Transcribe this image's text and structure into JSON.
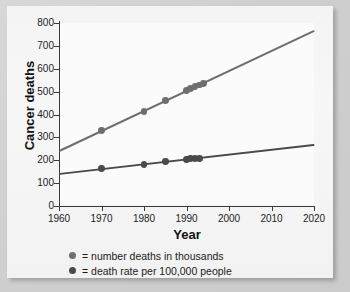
{
  "chart_data": {
    "type": "scatter",
    "title": "",
    "xlabel": "Year",
    "ylabel": "Cancer deaths",
    "xlim": [
      1960,
      2020
    ],
    "ylim": [
      0,
      800
    ],
    "xticks": [
      1960,
      1970,
      1980,
      1990,
      2000,
      2010,
      2020
    ],
    "yticks": [
      0,
      100,
      200,
      300,
      400,
      500,
      600,
      700,
      800
    ],
    "grid": false,
    "legend_position": "below",
    "series": [
      {
        "name": "number deaths in thousands",
        "color": "#6e6e6e",
        "marker": "circle",
        "points": [
          {
            "x": 1970,
            "y": 330
          },
          {
            "x": 1980,
            "y": 414
          },
          {
            "x": 1985,
            "y": 461
          },
          {
            "x": 1990,
            "y": 505
          },
          {
            "x": 1991,
            "y": 514
          },
          {
            "x": 1992,
            "y": 521
          },
          {
            "x": 1993,
            "y": 529
          },
          {
            "x": 1994,
            "y": 534
          }
        ],
        "trendline": {
          "x": [
            1960,
            2020
          ],
          "y": [
            245,
            770
          ]
        }
      },
      {
        "name": "death rate per 100,000 people",
        "color": "#4a4a4a",
        "marker": "circle",
        "points": [
          {
            "x": 1970,
            "y": 163
          },
          {
            "x": 1980,
            "y": 183
          },
          {
            "x": 1985,
            "y": 193
          },
          {
            "x": 1990,
            "y": 205
          },
          {
            "x": 1991,
            "y": 207
          },
          {
            "x": 1992,
            "y": 206
          },
          {
            "x": 1993,
            "y": 206
          }
        ],
        "trendline": {
          "x": [
            1960,
            2020
          ],
          "y": [
            143,
            270
          ]
        }
      }
    ]
  },
  "axes": {
    "y_title": "Cancer deaths",
    "x_title": "Year",
    "y_tick_labels": [
      "800",
      "700",
      "600",
      "500",
      "400",
      "300",
      "200",
      "100",
      "0"
    ],
    "x_tick_labels": [
      "1960",
      "1970",
      "1980",
      "1990",
      "2000",
      "2010",
      "2020"
    ]
  },
  "legend": {
    "items": [
      {
        "marker_name": "legend-dot-number-deaths",
        "color": "#6e6e6e",
        "label": "= number deaths in thousands"
      },
      {
        "marker_name": "legend-dot-death-rate",
        "color": "#4a4a4a",
        "label": "= death rate per 100,000 people"
      }
    ]
  },
  "colors": {
    "series_light": "#6e6e6e",
    "series_dark": "#4a4a4a",
    "axis": "#3a3a3a",
    "panel": "#fbfbfb",
    "card": "#f4f4f4",
    "backdrop": "#d6d6d6"
  }
}
